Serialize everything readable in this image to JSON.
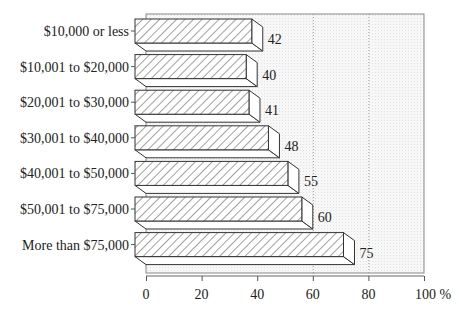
{
  "chart_data": {
    "type": "bar",
    "orientation": "horizontal",
    "style": "3d-hatched",
    "title": "",
    "xlabel": "%",
    "ylabel": "",
    "categories": [
      "$10,000 or less",
      "$10,001 to $20,000",
      "$20,001 to $30,000",
      "$30,001 to $40,000",
      "$40,001 to $50,000",
      "$50,001 to $75,000",
      "More than $75,000"
    ],
    "values": [
      42,
      40,
      41,
      48,
      55,
      60,
      75
    ],
    "data_labels": [
      "42",
      "40",
      "41",
      "48",
      "55",
      "60",
      "75"
    ],
    "xlim": [
      0,
      100
    ],
    "x_ticks": [
      "0",
      "20",
      "40",
      "60",
      "80",
      "100 %"
    ],
    "gridlines": {
      "dotted_at": [
        60,
        80
      ]
    },
    "legend": null
  },
  "colors": {
    "bar_outline": "#333333",
    "hatch": "#444444",
    "plot_background": "#f4f4f4",
    "frame": "#888888",
    "grid": "#999999",
    "text": "#222222"
  }
}
